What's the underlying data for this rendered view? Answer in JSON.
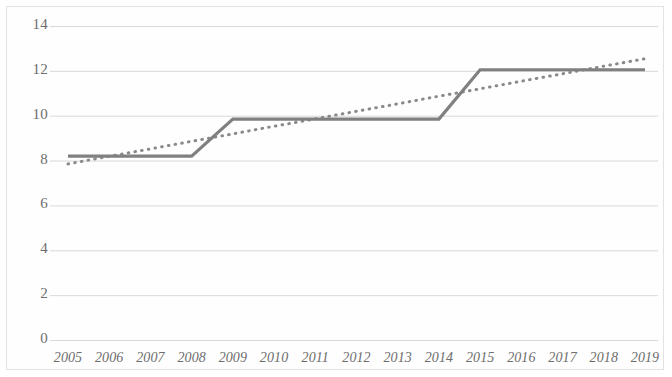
{
  "chart_data": {
    "type": "line",
    "title": "",
    "subtitle": "",
    "xlabel": "",
    "ylabel": "",
    "grid": true,
    "legend": "none",
    "xlim": [
      2005,
      2019
    ],
    "ylim": [
      0,
      14
    ],
    "y_ticks": [
      0,
      2,
      4,
      6,
      8,
      10,
      12,
      14
    ],
    "x_ticks": [
      "2005",
      "2006",
      "2007",
      "2008",
      "2009",
      "2010",
      "2011",
      "2012",
      "2013",
      "2014",
      "2015",
      "2016",
      "2017",
      "2018",
      "2019"
    ],
    "categories": [
      2005,
      2006,
      2007,
      2008,
      2009,
      2010,
      2011,
      2012,
      2013,
      2014,
      2015,
      2016,
      2017,
      2018,
      2019
    ],
    "series": [
      {
        "name": "value",
        "style": "solid",
        "color": "#808080",
        "values": [
          8.2,
          8.2,
          8.2,
          8.2,
          9.85,
          9.85,
          9.85,
          9.85,
          9.85,
          9.85,
          12.05,
          12.05,
          12.05,
          12.05,
          12.05
        ]
      },
      {
        "name": "trendline",
        "style": "dotted",
        "color": "#8a8a8a",
        "values": [
          7.85,
          8.19,
          8.52,
          8.86,
          9.19,
          9.53,
          9.86,
          10.2,
          10.53,
          10.87,
          11.2,
          11.54,
          11.87,
          12.21,
          12.54
        ]
      }
    ]
  },
  "colors": {
    "background": "#ffffff",
    "gridline": "#d9d9d9",
    "axis_text": "#6e6e6e",
    "series_line": "#808080",
    "trend_line": "#8a8a8a",
    "frame": "#e2e2e2"
  }
}
